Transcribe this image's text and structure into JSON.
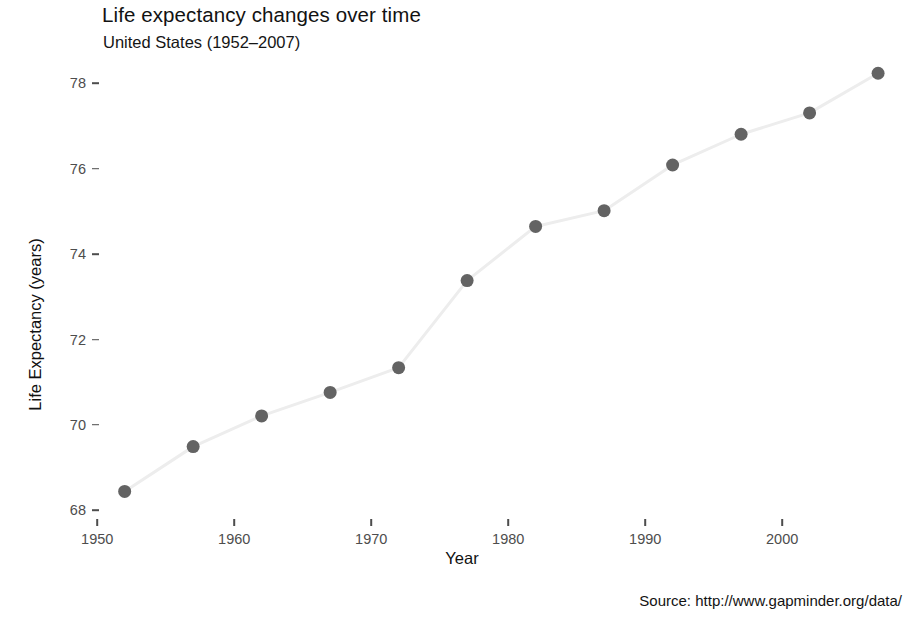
{
  "chart_data": {
    "type": "line",
    "title": "Life expectancy changes over time",
    "subtitle": "United States (1952–2007)",
    "caption": "Source: http://www.gapminder.org/data/",
    "xlabel": "Year",
    "ylabel": "Life Expectancy (years)",
    "x": [
      1952,
      1957,
      1962,
      1967,
      1972,
      1977,
      1982,
      1987,
      1992,
      1997,
      2002,
      2007
    ],
    "values": [
      68.44,
      69.49,
      70.21,
      70.76,
      71.34,
      73.38,
      74.65,
      75.02,
      76.09,
      76.81,
      77.31,
      78.24
    ],
    "series": [
      {
        "name": "United States",
        "values": [
          68.44,
          69.49,
          70.21,
          70.76,
          71.34,
          73.38,
          74.65,
          75.02,
          76.09,
          76.81,
          77.31,
          78.24
        ]
      }
    ],
    "xlim": [
      1950.2,
      2008.6
    ],
    "ylim": [
      67.7,
      78.55
    ],
    "xticks": [
      1950,
      1960,
      1970,
      1980,
      1990,
      2000
    ],
    "xtick_labels": [
      "1950",
      "1960",
      "1970",
      "1980",
      "1990",
      "2000"
    ],
    "yticks": [
      68,
      70,
      72,
      74,
      76,
      78
    ],
    "ytick_labels": [
      "68",
      "70",
      "72",
      "74",
      "76",
      "78"
    ],
    "grid": false,
    "legend": "none",
    "point_color": "#636363",
    "line_color": "#ededed",
    "panel_background": "#ffffff",
    "point_size": 13,
    "line_width": 3
  }
}
